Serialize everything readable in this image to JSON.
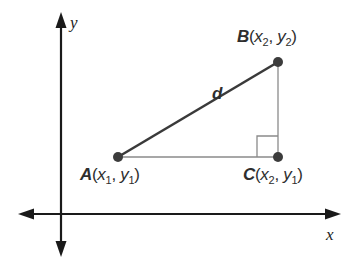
{
  "diagram": {
    "type": "coordinate-plane-distance-triangle",
    "axes": {
      "x_label": "x",
      "y_label": "y"
    },
    "points": {
      "A": {
        "name": "A",
        "x": "x",
        "x_sub": "1",
        "y": "y",
        "y_sub": "1"
      },
      "B": {
        "name": "B",
        "x": "x",
        "x_sub": "2",
        "y": "y",
        "y_sub": "2"
      },
      "C": {
        "name": "C",
        "x": "x",
        "x_sub": "2",
        "y": "y",
        "y_sub": "1"
      }
    },
    "segments": {
      "hypotenuse_label": "d"
    },
    "punct": {
      "open": "(",
      "comma": ", ",
      "close": ")"
    },
    "colors": {
      "axis": "#1a1a1a",
      "hypotenuse": "#3a3a3a",
      "legs": "#8a8a8a",
      "points": "#3c3c3c",
      "text": "#2e2e2e"
    }
  }
}
